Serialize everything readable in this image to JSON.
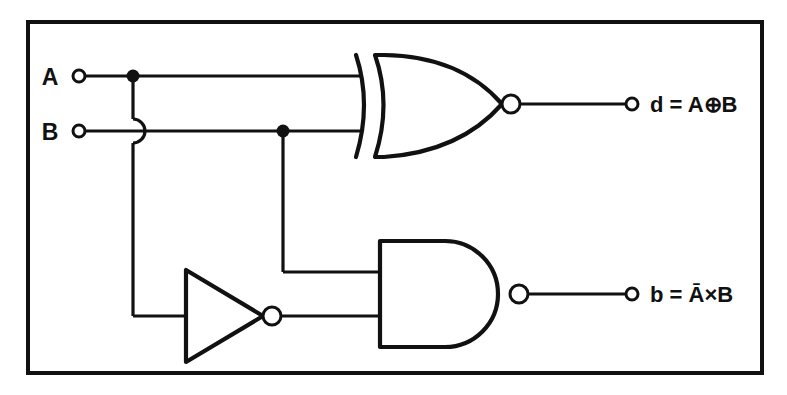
{
  "diagram": {
    "type": "logic-circuit-schematic",
    "frame": {
      "stroke_color": "#111111",
      "fill_color": "#ffffff"
    },
    "inputs": [
      {
        "id": "A",
        "label": "A",
        "terminal": "open-circle"
      },
      {
        "id": "B",
        "label": "B",
        "terminal": "open-circle"
      }
    ],
    "outputs": [
      {
        "id": "d",
        "label": "d = A⊕B",
        "expression_lhs": "d",
        "equals": "=",
        "operand_left": "A",
        "operator": "⊕",
        "operand_right": "B",
        "terminal": "open-circle"
      },
      {
        "id": "b",
        "label": "b = Ā×B",
        "expression_lhs": "b",
        "equals": "=",
        "operand_left": "A",
        "operand_left_negated": true,
        "operator": "×",
        "operand_right": "B",
        "terminal": "open-circle"
      }
    ],
    "gates": [
      {
        "id": "xor1",
        "type": "XOR",
        "shape": "xor-with-bubble",
        "inputs": [
          "A",
          "B"
        ],
        "output": "d",
        "output_bubble": true
      },
      {
        "id": "not1",
        "type": "NOT",
        "shape": "triangle-with-bubble",
        "inputs": [
          "A"
        ],
        "output": "notA",
        "output_bubble": true
      },
      {
        "id": "and1",
        "type": "AND",
        "shape": "d-shape-with-bubble",
        "inputs": [
          "notA",
          "B"
        ],
        "output": "b",
        "output_bubble": true
      }
    ],
    "junctions": [
      {
        "id": "j-a",
        "on_net": "A",
        "x": 133,
        "y": 76
      },
      {
        "id": "j-b",
        "on_net": "B",
        "x": 283,
        "y": 131
      }
    ],
    "wire_crossings": [
      {
        "id": "hop-1",
        "style": "semicircular-hop",
        "x": 133,
        "y": 131,
        "description": "A branch hops over B wire"
      }
    ]
  }
}
